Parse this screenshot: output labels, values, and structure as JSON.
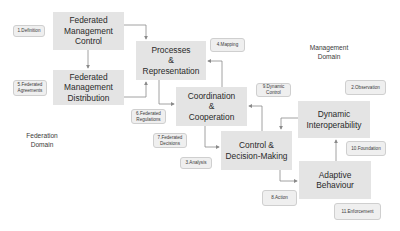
{
  "diagram": {
    "domains": [
      {
        "id": "management",
        "label": "Management\nDomain"
      },
      {
        "id": "federation",
        "label": "Federation\nDomain"
      }
    ],
    "boxes": [
      {
        "id": "fed-mgmt-control",
        "label": "Federated\nManagement\nControl"
      },
      {
        "id": "fed-mgmt-distribution",
        "label": "Federated\nManagement\nDistribution"
      },
      {
        "id": "processes-representation",
        "label": "Processes\n&\nRepresentation"
      },
      {
        "id": "coordination-cooperation",
        "label": "Coordination\n&\nCooperation"
      },
      {
        "id": "control-decision-making",
        "label": "Control &\nDecision-Making"
      },
      {
        "id": "dynamic-interoperability",
        "label": "Dynamic\nInteroperability"
      },
      {
        "id": "adaptive-behaviour",
        "label": "Adaptive\nBehaviour"
      }
    ],
    "tags": [
      {
        "id": "definition",
        "label": "1.Definition"
      },
      {
        "id": "observation",
        "label": "2.Observation"
      },
      {
        "id": "analysis",
        "label": "3.Analysis"
      },
      {
        "id": "mapping",
        "label": "4.Mapping"
      },
      {
        "id": "federated-agreements",
        "label": "5.Federated\nAgreements"
      },
      {
        "id": "federated-regulations",
        "label": "6.Federated\nRegulations"
      },
      {
        "id": "federated-decisions",
        "label": "7.Federated\nDecisions"
      },
      {
        "id": "action",
        "label": "8.Action"
      },
      {
        "id": "dynamic-control",
        "label": "9.Dynamic\nControl"
      },
      {
        "id": "foundation",
        "label": "10.Foundation"
      },
      {
        "id": "enforcement",
        "label": "11.Enforcement"
      }
    ],
    "connections": [
      {
        "from": "fed-mgmt-control",
        "to": "fed-mgmt-distribution"
      },
      {
        "from": "fed-mgmt-control",
        "to": "processes-representation"
      },
      {
        "from": "fed-mgmt-distribution",
        "to": "processes-representation"
      },
      {
        "from": "processes-representation",
        "to": "coordination-cooperation"
      },
      {
        "from": "coordination-cooperation",
        "to": "processes-representation"
      },
      {
        "from": "coordination-cooperation",
        "to": "control-decision-making"
      },
      {
        "from": "control-decision-making",
        "to": "coordination-cooperation"
      },
      {
        "from": "control-decision-making",
        "to": "adaptive-behaviour"
      },
      {
        "from": "dynamic-interoperability",
        "to": "control-decision-making"
      },
      {
        "from": "adaptive-behaviour",
        "to": "dynamic-interoperability"
      }
    ],
    "colors": {
      "box_fill": "#e4e4e4",
      "tag_fill": "#efefef",
      "arrow": "#8a8a8a",
      "text": "#2a2a2a"
    }
  }
}
